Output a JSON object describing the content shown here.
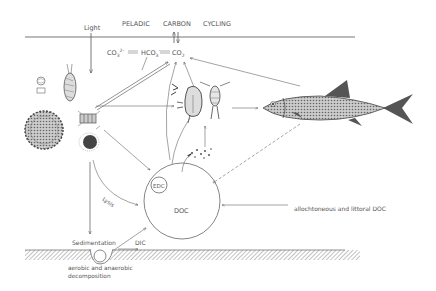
{
  "title": {
    "word1": "PELADIC",
    "word2": "CARBON",
    "word3": "CYCLING"
  },
  "labels": {
    "light": "Light",
    "co3": "CO",
    "co3_sub": "3",
    "co3_sup": "2-",
    "hco3": "HCO",
    "hco3_sub": "3",
    "hco3_sup": "-",
    "co2": "CO",
    "co2_sub": "2",
    "edc": "EDC",
    "doc": "DOC",
    "lysis": "Lysis",
    "sedimentation": "Sedimentation",
    "dic": "DIC",
    "decomposition_line1": "aerobic and anaerobic",
    "decomposition_line2": "decomposition",
    "allochthonous": "allochtoneous and littoral DOC"
  },
  "organisms": [
    "small-algae",
    "ciliate",
    "colonial-alga",
    "diatom-chain",
    "algal-colony",
    "daphnia",
    "copepod",
    "fish",
    "bacteria"
  ],
  "colors": {
    "line": "#666666",
    "text": "#555555",
    "sediment": "#999999",
    "background": "#ffffff"
  }
}
